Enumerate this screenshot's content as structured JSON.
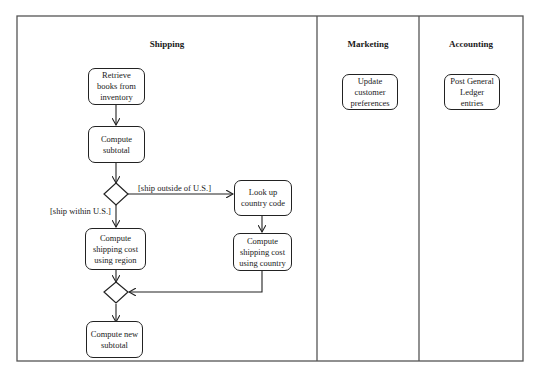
{
  "diagram": {
    "type": "UML activity diagram with swimlanes",
    "lanes": [
      {
        "id": "shipping",
        "title": "Shipping"
      },
      {
        "id": "marketing",
        "title": "Marketing"
      },
      {
        "id": "accounting",
        "title": "Accounting"
      }
    ],
    "nodes": {
      "retrieve_books": {
        "label": "Retrieve books from inventory",
        "lines": [
          "Retrieve",
          "books from",
          "inventory"
        ]
      },
      "compute_subtotal": {
        "label": "Compute subtotal",
        "lines": [
          "Compute",
          "subtotal"
        ]
      },
      "ship_cost_region": {
        "label": "Compute shipping cost using region",
        "lines": [
          "Compute",
          "shipping cost",
          "using region"
        ]
      },
      "lookup_country": {
        "label": "Look up country code",
        "lines": [
          "Look up",
          "country code"
        ]
      },
      "ship_cost_country": {
        "label": "Compute shipping cost using country",
        "lines": [
          "Compute",
          "shipping cost",
          "using country"
        ]
      },
      "compute_new_subtotal": {
        "label": "Compute new subtotal",
        "lines": [
          "Compute new",
          "subtotal"
        ]
      },
      "update_prefs": {
        "label": "Update customer preferences",
        "lines": [
          "Update",
          "customer",
          "preferences"
        ]
      },
      "post_ledger": {
        "label": "Post General Ledger entries",
        "lines": [
          "Post General",
          "Ledger",
          "entries"
        ]
      }
    },
    "guards": {
      "outside_us": "[ship outside of U.S.]",
      "within_us": "[ship within U.S.]"
    },
    "edges": [
      {
        "from": "retrieve_books",
        "to": "compute_subtotal"
      },
      {
        "from": "compute_subtotal",
        "to": "decision"
      },
      {
        "from": "decision",
        "to": "ship_cost_region",
        "guard": "[ship within U.S.]"
      },
      {
        "from": "decision",
        "to": "lookup_country",
        "guard": "[ship outside of U.S.]"
      },
      {
        "from": "lookup_country",
        "to": "ship_cost_country"
      },
      {
        "from": "ship_cost_region",
        "to": "merge"
      },
      {
        "from": "ship_cost_country",
        "to": "merge"
      },
      {
        "from": "merge",
        "to": "compute_new_subtotal"
      }
    ],
    "colors": {
      "line": "#222222",
      "frame": "#555555",
      "background": "#ffffff"
    }
  }
}
